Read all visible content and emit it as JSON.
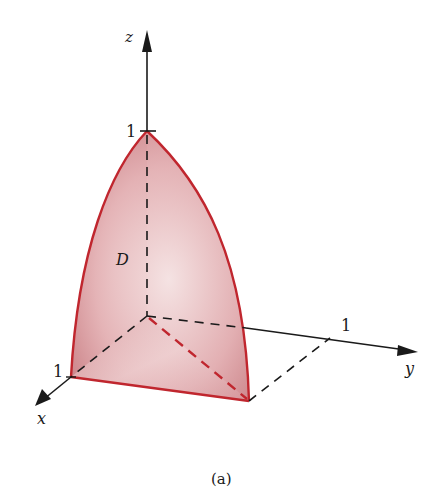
{
  "figure": {
    "caption": "(a)",
    "region_label": "D",
    "axes": {
      "x": {
        "label": "x",
        "tick_label": "1"
      },
      "y": {
        "label": "y",
        "tick_label": "1"
      },
      "z": {
        "label": "z",
        "tick_label": "1"
      }
    },
    "colors": {
      "surface_fill_light": "#f3dede",
      "surface_fill_dark": "#c77b80",
      "surface_edge": "#c0262e",
      "axis": "#1a1a1a"
    }
  }
}
